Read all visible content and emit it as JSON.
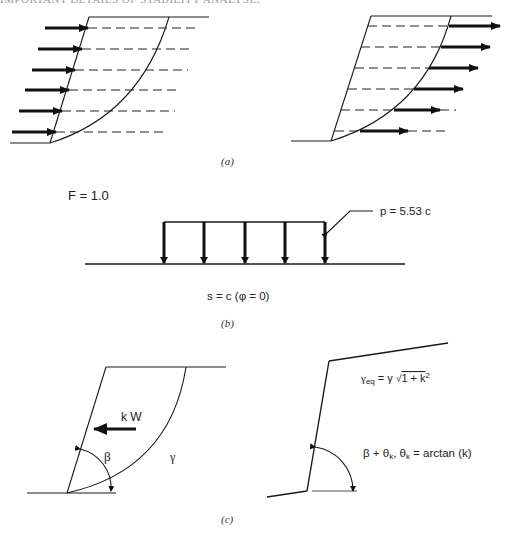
{
  "header": {
    "running_title": "IMPORTANT DETAILS OF STABILITY ANALYSES"
  },
  "panel_a": {
    "caption": "(a)",
    "left_diagram": {
      "description": "slope with force arrows acting toward slope face",
      "top_surface": [
        [
          89,
          17
        ],
        [
          209,
          17
        ]
      ],
      "slope_face": [
        [
          89,
          17
        ],
        [
          50,
          143
        ]
      ],
      "toe_ground": [
        [
          10,
          143
        ],
        [
          50,
          143
        ]
      ],
      "slip_curve": "M50,143 Q140,115 169,17",
      "rows": [
        {
          "y": 28,
          "arrow_x1": 45,
          "arrow_x2": 88,
          "dash_x1": 88,
          "dash_x2": 200
        },
        {
          "y": 49,
          "arrow_x1": 38,
          "arrow_x2": 82,
          "dash_x1": 82,
          "dash_x2": 194
        },
        {
          "y": 70,
          "arrow_x1": 32,
          "arrow_x2": 75,
          "dash_x1": 75,
          "dash_x2": 188
        },
        {
          "y": 90,
          "arrow_x1": 25,
          "arrow_x2": 69,
          "dash_x1": 69,
          "dash_x2": 181
        },
        {
          "y": 111,
          "arrow_x1": 19,
          "arrow_x2": 62,
          "dash_x1": 62,
          "dash_x2": 175
        },
        {
          "y": 132,
          "arrow_x1": 12,
          "arrow_x2": 56,
          "dash_x1": 56,
          "dash_x2": 168
        }
      ]
    },
    "right_diagram": {
      "description": "slope with force arrows acting outward from slip surface",
      "top_surface": [
        [
          371,
          16
        ],
        [
          492,
          16
        ]
      ],
      "slope_face": [
        [
          371,
          16
        ],
        [
          331,
          141
        ]
      ],
      "toe_ground": [
        [
          291,
          141
        ],
        [
          331,
          141
        ]
      ],
      "slip_curve": "M331,141 Q425,112 451,16",
      "rows": [
        {
          "y": 26,
          "dash_x1": 368,
          "dash_x2": 449,
          "arrow_x1": 449,
          "arrow_x2": 500,
          "tail_x2": null
        },
        {
          "y": 47,
          "dash_x1": 361,
          "dash_x2": 441,
          "arrow_x1": 441,
          "arrow_x2": 490,
          "tail_x2": null
        },
        {
          "y": 68,
          "dash_x1": 355,
          "dash_x2": 429,
          "arrow_x1": 429,
          "arrow_x2": 478,
          "tail_x2": null
        },
        {
          "y": 89,
          "dash_x1": 348,
          "dash_x2": 414,
          "arrow_x1": 414,
          "arrow_x2": 463,
          "tail_x2": null
        },
        {
          "y": 110,
          "dash_x1": 341,
          "dash_x2": 394,
          "arrow_x1": 394,
          "arrow_x2": 440,
          "tail_x2": 456
        },
        {
          "y": 131,
          "dash_x1": 335,
          "dash_x2": 360,
          "arrow_x1": 360,
          "arrow_x2": 408,
          "tail_x2": 450
        }
      ]
    }
  },
  "panel_b": {
    "caption": "(b)",
    "factor_label": "F = 1.0",
    "load_label": "p = 5.53 c",
    "strength_label": "s = c (φ = 0)",
    "load_top": {
      "y": 222,
      "x1": 164,
      "x2": 325
    },
    "load_arrows_x": [
      164,
      204,
      245,
      285,
      325
    ],
    "arrow_bottom_y": 263,
    "ground": {
      "y": 264,
      "x1": 85,
      "x2": 405
    },
    "leader": [
      [
        327,
        233
      ],
      [
        350,
        211
      ],
      [
        373,
        211
      ]
    ]
  },
  "panel_c": {
    "caption": "(c)",
    "left_diagram": {
      "force_label": "k W",
      "angle_label": "β",
      "unit_weight_label": "γ",
      "top_surface": [
        [
          106,
          367
        ],
        [
          226,
          367
        ]
      ],
      "slope_face": [
        [
          106,
          367
        ],
        [
          67,
          493
        ]
      ],
      "toe_ground": [
        [
          27,
          493
        ],
        [
          116,
          493
        ]
      ],
      "slip_curve": "M67,493 Q170,470 186,367",
      "kw_arrow": {
        "x1": 136,
        "x2": 94,
        "y": 429
      }
    },
    "right_diagram": {
      "unit_weight_formula": {
        "gamma": "γ",
        "sub": "eq",
        "eq": " = γ ",
        "root": "√",
        "radicand": "1 + k",
        "sup": "2"
      },
      "angle_formula": {
        "part1": "β + θ",
        "sub1": "k",
        "part2": ", θ",
        "sub2": "k",
        "part3": " = arctan (k)"
      },
      "top_surface": [
        [
          329,
          361
        ],
        [
          448,
          343
        ]
      ],
      "slope_face": [
        [
          329,
          361
        ],
        [
          307,
          491
        ]
      ],
      "toe_ground": [
        [
          267,
          497
        ],
        [
          307,
          491
        ]
      ],
      "angle_baseline": [
        [
          312,
          491
        ],
        [
          357,
          491
        ]
      ]
    }
  },
  "colors": {
    "ink": "#1a1a1a",
    "background": "#ffffff",
    "caption": "#333333"
  }
}
